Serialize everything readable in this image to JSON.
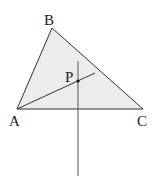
{
  "diagram": {
    "type": "geometry",
    "fill_color": "#ececec",
    "stroke_color": "#333333",
    "points": {
      "A": {
        "label": "A",
        "x": 17,
        "y": 109
      },
      "B": {
        "label": "B",
        "x": 52,
        "y": 28
      },
      "C": {
        "label": "C",
        "x": 143,
        "y": 109
      },
      "P": {
        "label": "P",
        "x": 78,
        "y": 81
      }
    },
    "labels": {
      "A": "A",
      "B": "B",
      "C": "C",
      "P": "P"
    },
    "segments": [
      {
        "name": "AB",
        "from": "A",
        "to": "B"
      },
      {
        "name": "BC",
        "from": "B",
        "to": "C"
      },
      {
        "name": "CA",
        "from": "C",
        "to": "A"
      },
      {
        "name": "A-through-P",
        "from": [
          17,
          109
        ],
        "to": [
          95,
          73
        ]
      },
      {
        "name": "vertical-through-P",
        "from": [
          78,
          61
        ],
        "to": [
          78,
          176
        ]
      }
    ]
  }
}
